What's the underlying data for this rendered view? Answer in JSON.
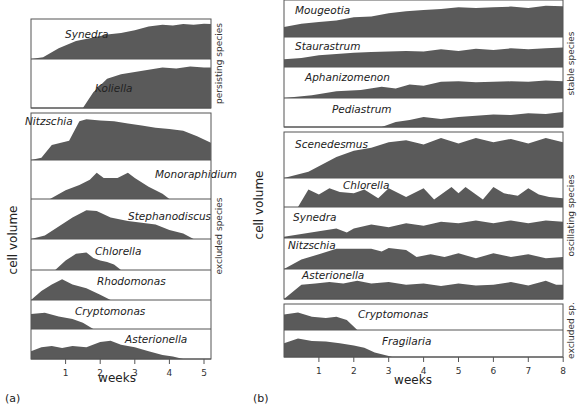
{
  "chart_data": [
    {
      "type": "area",
      "panel_label": "(a)",
      "xlabel": "weeks",
      "ylabel": "cell volume",
      "x_ticks": [
        1,
        2,
        3,
        4,
        5
      ],
      "xlim": [
        0,
        5.2
      ],
      "groups": [
        {
          "name": "persisting species",
          "series": [
            {
              "name": "Synedra",
              "x": [
                0,
                0.35,
                0.8,
                1.3,
                1.8,
                2.2,
                2.6,
                3.0,
                3.4,
                3.8,
                4.1,
                4.4,
                4.7,
                5.0,
                5.2
              ],
              "y": [
                0,
                0.05,
                0.3,
                0.5,
                0.6,
                0.68,
                0.72,
                0.8,
                0.9,
                0.95,
                0.93,
                0.97,
                0.95,
                0.98,
                0.97
              ]
            },
            {
              "name": "Koliella",
              "x": [
                0,
                1.5,
                1.8,
                2.2,
                2.6,
                3.0,
                3.4,
                3.8,
                4.2,
                4.6,
                5.0,
                5.2
              ],
              "y": [
                0,
                0,
                0.35,
                0.65,
                0.75,
                0.8,
                0.85,
                0.9,
                0.88,
                0.92,
                0.9,
                0.9
              ]
            }
          ]
        },
        {
          "name": "excluded species",
          "series": [
            {
              "name": "Nitzschia",
              "x": [
                0,
                0.3,
                0.6,
                1.1,
                1.4,
                1.6,
                2.0,
                2.4,
                2.8,
                3.2,
                3.6,
                4.0,
                4.4,
                4.8,
                5.2
              ],
              "y": [
                0,
                0.05,
                0.35,
                0.45,
                0.9,
                0.95,
                0.92,
                0.9,
                0.85,
                0.8,
                0.75,
                0.72,
                0.68,
                0.55,
                0.4
              ]
            },
            {
              "name": "Monoraphidium",
              "x": [
                0,
                0.55,
                1.0,
                1.4,
                1.7,
                1.9,
                2.1,
                2.5,
                2.8,
                3.0,
                3.4,
                3.8,
                4.0
              ],
              "y": [
                0,
                0,
                0.25,
                0.4,
                0.55,
                0.75,
                0.6,
                0.6,
                0.75,
                0.6,
                0.35,
                0.15,
                0
              ]
            },
            {
              "name": "Stephanodiscus",
              "x": [
                0,
                0.4,
                0.8,
                1.2,
                1.6,
                1.9,
                2.3,
                2.8,
                3.2,
                3.6,
                4.0,
                4.4,
                4.7
              ],
              "y": [
                0,
                0.1,
                0.35,
                0.6,
                0.8,
                0.78,
                0.6,
                0.5,
                0.45,
                0.4,
                0.25,
                0.15,
                0
              ]
            },
            {
              "name": "Chlorella",
              "x": [
                0,
                0.7,
                1.0,
                1.3,
                1.6,
                1.8,
                2.0,
                2.2,
                2.4,
                2.6
              ],
              "y": [
                0,
                0,
                0.35,
                0.6,
                0.65,
                0.45,
                0.35,
                0.3,
                0.2,
                0
              ]
            },
            {
              "name": "Rhodomonas",
              "x": [
                0,
                0.3,
                0.6,
                0.9,
                1.2,
                1.6,
                2.0,
                2.3
              ],
              "y": [
                0,
                0.35,
                0.6,
                0.8,
                0.6,
                0.45,
                0.2,
                0
              ]
            },
            {
              "name": "Cryptomonas",
              "x": [
                0,
                0.4,
                0.8,
                1.2,
                1.5,
                1.8
              ],
              "y": [
                0.6,
                0.65,
                0.5,
                0.4,
                0.25,
                0
              ]
            },
            {
              "name": "Asterionella",
              "x": [
                0,
                0.3,
                0.6,
                0.9,
                1.2,
                1.6,
                2.0,
                2.3,
                2.6,
                3.0,
                3.4,
                3.8,
                4.1,
                4.4
              ],
              "y": [
                0.3,
                0.45,
                0.5,
                0.42,
                0.5,
                0.45,
                0.65,
                0.7,
                0.55,
                0.45,
                0.3,
                0.15,
                0.1,
                0
              ]
            }
          ]
        }
      ]
    },
    {
      "type": "area",
      "panel_label": "(b)",
      "xlabel": "weeks",
      "ylabel": "cell volume",
      "x_ticks": [
        1,
        2,
        3,
        4,
        5,
        6,
        7,
        8
      ],
      "xlim": [
        0,
        8
      ],
      "groups": [
        {
          "name": "stable species",
          "series": [
            {
              "name": "Mougeotia",
              "x": [
                0,
                0.5,
                1.0,
                1.5,
                2.0,
                2.5,
                3.0,
                3.5,
                4.0,
                4.5,
                5.0,
                5.5,
                6.0,
                6.5,
                7.0,
                7.5,
                8.0
              ],
              "y": [
                0.3,
                0.4,
                0.45,
                0.5,
                0.6,
                0.62,
                0.72,
                0.78,
                0.82,
                0.85,
                0.9,
                0.88,
                0.9,
                0.92,
                0.88,
                0.95,
                0.93
              ]
            },
            {
              "name": "Staurastrum",
              "x": [
                0,
                0.5,
                1.0,
                1.5,
                2.0,
                2.5,
                3.0,
                3.5,
                4.0,
                4.5,
                5.0,
                5.5,
                6.0,
                6.5,
                7.0,
                7.5,
                8.0
              ],
              "y": [
                0.3,
                0.35,
                0.45,
                0.5,
                0.55,
                0.58,
                0.6,
                0.62,
                0.6,
                0.68,
                0.62,
                0.7,
                0.65,
                0.72,
                0.68,
                0.72,
                0.75
              ]
            },
            {
              "name": "Aphanizomenon",
              "x": [
                0,
                0.8,
                1.5,
                2.2,
                2.8,
                3.2,
                3.6,
                4.0,
                4.5,
                5.0,
                5.5,
                6.0,
                6.5,
                7.0,
                7.5,
                8.0
              ],
              "y": [
                0,
                0.1,
                0.25,
                0.3,
                0.42,
                0.35,
                0.5,
                0.45,
                0.6,
                0.62,
                0.58,
                0.6,
                0.62,
                0.6,
                0.65,
                0.62
              ]
            },
            {
              "name": "Pediastrum",
              "x": [
                0,
                2.8,
                3.2,
                3.6,
                4.0,
                4.5,
                5.0,
                5.5,
                6.0,
                6.5,
                7.0,
                7.5,
                8.0
              ],
              "y": [
                0,
                0,
                0.2,
                0.28,
                0.4,
                0.32,
                0.4,
                0.45,
                0.5,
                0.48,
                0.55,
                0.52,
                0.6
              ]
            }
          ]
        },
        {
          "name": "oscillating species",
          "series": [
            {
              "name": "Scenedesmus",
              "x": [
                0,
                0.7,
                1.5,
                2.0,
                2.5,
                3.0,
                3.5,
                4.0,
                4.5,
                5.0,
                5.5,
                6.0,
                6.5,
                7.0,
                7.5,
                8.0
              ],
              "y": [
                0,
                0.15,
                0.5,
                0.65,
                0.72,
                0.85,
                0.9,
                0.8,
                0.95,
                0.82,
                0.95,
                0.85,
                0.93,
                0.82,
                0.95,
                0.85
              ]
            },
            {
              "name": "Chlorella",
              "x": [
                0,
                0.4,
                0.7,
                1.0,
                1.3,
                1.6,
                2.0,
                2.3,
                2.7,
                3.0,
                3.5,
                4.0,
                4.3,
                4.8,
                5.0,
                5.2,
                5.7,
                6.0,
                6.3,
                6.7,
                7.0,
                7.3,
                7.6,
                8.0
              ],
              "y": [
                0,
                0,
                0.7,
                0.5,
                0.75,
                0.6,
                0.55,
                0.7,
                0.35,
                0.75,
                0.4,
                0.75,
                0.3,
                0.8,
                0.55,
                0.8,
                0.3,
                0.8,
                0.55,
                0.45,
                0.75,
                0.5,
                0.4,
                0.35
              ]
            },
            {
              "name": "Synedra",
              "x": [
                0,
                0.5,
                1.0,
                1.5,
                1.8,
                2.0,
                2.5,
                3.0,
                3.5,
                4.0,
                4.5,
                5.0,
                5.5,
                6.0,
                6.5,
                7.0,
                7.5,
                8.0
              ],
              "y": [
                0.05,
                0.15,
                0.25,
                0.35,
                0.2,
                0.35,
                0.5,
                0.4,
                0.55,
                0.45,
                0.6,
                0.55,
                0.65,
                0.55,
                0.65,
                0.55,
                0.65,
                0.6
              ]
            },
            {
              "name": "Nitzschia",
              "x": [
                0,
                0.5,
                1.0,
                1.5,
                2.0,
                2.5,
                2.8,
                3.0,
                3.5,
                3.8,
                4.2,
                4.6,
                5.0,
                5.5,
                6.0,
                6.5,
                7.0,
                7.5,
                8.0
              ],
              "y": [
                0,
                0.35,
                0.55,
                0.75,
                0.75,
                0.75,
                0.65,
                0.78,
                0.7,
                0.45,
                0.55,
                0.45,
                0.58,
                0.4,
                0.58,
                0.45,
                0.55,
                0.4,
                0.45
              ]
            },
            {
              "name": "Asterionella",
              "x": [
                0,
                0.5,
                0.9,
                1.3,
                1.7,
                2.1,
                2.5,
                3.0,
                3.5,
                4.0,
                4.5,
                5.0,
                5.5,
                6.0,
                6.5,
                7.0,
                7.5,
                7.8,
                8.0
              ],
              "y": [
                0,
                0.55,
                0.6,
                0.65,
                0.6,
                0.7,
                0.6,
                0.65,
                0.55,
                0.6,
                0.5,
                0.6,
                0.52,
                0.55,
                0.65,
                0.52,
                0.7,
                0.55,
                0.55
              ]
            }
          ]
        },
        {
          "name": "excluded sp.",
          "series": [
            {
              "name": "Cryptomonas",
              "x": [
                0,
                0.4,
                0.8,
                1.2,
                1.5,
                1.8,
                2.1
              ],
              "y": [
                0.7,
                0.8,
                0.6,
                0.55,
                0.6,
                0.45,
                0
              ]
            },
            {
              "name": "Fragilaria",
              "x": [
                0,
                0.4,
                0.8,
                1.2,
                1.6,
                2.0,
                2.3,
                2.6,
                3.0,
                3.1
              ],
              "y": [
                0.6,
                0.8,
                0.7,
                0.68,
                0.6,
                0.5,
                0.4,
                0.2,
                0.05,
                0
              ]
            }
          ]
        }
      ]
    }
  ],
  "layout": {
    "fill": "#5a5a5a",
    "border": "#555555",
    "panels": [
      {
        "x0": 31,
        "x1": 211,
        "pxPerUnit": 34.6,
        "tickY": 360,
        "groups": [
          {
            "top": 19,
            "rows": [
              40,
              49
            ],
            "labelX": [
              52,
              62
            ]
          },
          {
            "top": 113,
            "rows": [
              47,
              39,
              40,
              31,
              30,
              29,
              30
            ]
          }
        ],
        "labelPos": [
          [
            65,
            38
          ],
          [
            95,
            92
          ],
          [
            25,
            125
          ],
          [
            155,
            178
          ],
          [
            128,
            220
          ],
          [
            95,
            255
          ],
          [
            97,
            285
          ],
          [
            75,
            315
          ],
          [
            125,
            343
          ]
        ],
        "groupLabelX": 222,
        "axisLabelPos": [
          117,
          382
        ],
        "ylabelPos": [
          17,
          240
        ],
        "panelLabelPos": [
          5,
          402
        ]
      },
      {
        "x0": 284,
        "x1": 563,
        "pxPerUnit": 34.9,
        "tickY": 358,
        "groups": [
          {
            "top": 0,
            "rows": [
              37,
              30,
              31,
              29
            ]
          },
          {
            "top": 132,
            "rows": [
              46,
              29,
              31,
              31,
              30
            ]
          },
          {
            "top": 304,
            "rows": [
              26,
              27
            ]
          }
        ],
        "labelPos": [
          [
            295,
            14
          ],
          [
            295,
            50
          ],
          [
            305,
            81
          ],
          [
            332,
            113
          ],
          [
            295,
            148
          ],
          [
            343,
            189
          ],
          [
            293,
            221
          ],
          [
            288,
            249
          ],
          [
            302,
            279
          ],
          [
            358,
            318
          ],
          [
            382,
            345
          ]
        ],
        "groupLabelX": 574,
        "axisLabelPos": [
          413,
          384
        ],
        "ylabelPos": [
          263,
          205
        ],
        "panelLabelPos": [
          253,
          402
        ]
      }
    ]
  }
}
